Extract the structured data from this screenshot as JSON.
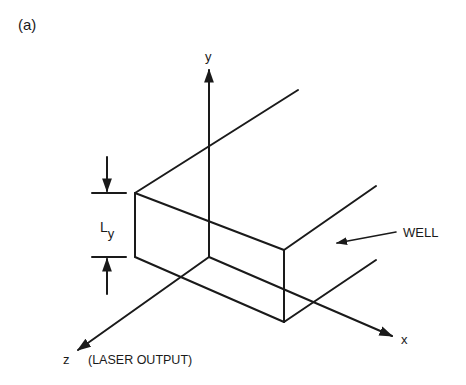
{
  "figure": {
    "panel_label": "(a)",
    "axes": {
      "x_label": "x",
      "y_label": "y",
      "z_label": "z",
      "z_annotation": "(LASER OUTPUT)"
    },
    "dimension": {
      "label_main": "L",
      "label_sub": "y"
    },
    "callout": {
      "label": "WELL"
    },
    "line_color": "#1a1a1a"
  }
}
